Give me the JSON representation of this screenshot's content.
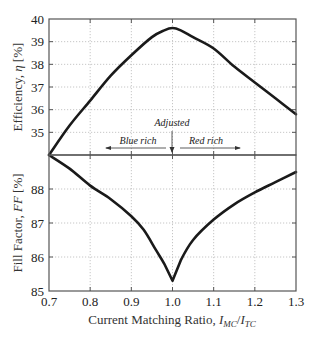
{
  "chart_data": [
    {
      "type": "line",
      "title": "",
      "ylabel": "Efficiency, η [%]",
      "xlabel": "",
      "xlim": [
        0.7,
        1.3
      ],
      "ylim": [
        34,
        40
      ],
      "yticks": [
        "35",
        "36",
        "37",
        "38",
        "39",
        "40"
      ],
      "grid": true,
      "x": [
        0.7,
        0.75,
        0.8,
        0.85,
        0.9,
        0.95,
        0.98,
        1.0,
        1.02,
        1.05,
        1.1,
        1.15,
        1.2,
        1.25,
        1.3
      ],
      "series": [
        {
          "name": "Efficiency",
          "values": [
            34.0,
            35.3,
            36.4,
            37.5,
            38.4,
            39.2,
            39.5,
            39.6,
            39.5,
            39.2,
            38.7,
            37.9,
            37.2,
            36.5,
            35.8
          ]
        }
      ],
      "annotations": [
        {
          "text": "Adjusted",
          "x": 1.0
        },
        {
          "text": "Blue rich",
          "direction": "left"
        },
        {
          "text": "Red rich",
          "direction": "right"
        }
      ]
    },
    {
      "type": "line",
      "title": "",
      "ylabel": "Fill Factor, FF [%]",
      "xlabel": "Current Matching Ratio, I_MC/I_TC",
      "xlim": [
        0.7,
        1.3
      ],
      "ylim": [
        85,
        89
      ],
      "yticks": [
        "85",
        "86",
        "87",
        "88"
      ],
      "xticks": [
        "0.7",
        "0.8",
        "0.9",
        "1.0",
        "1.1",
        "1.2",
        "1.3"
      ],
      "grid": true,
      "x": [
        0.7,
        0.75,
        0.8,
        0.85,
        0.9,
        0.93,
        0.96,
        0.98,
        1.0,
        1.02,
        1.05,
        1.1,
        1.15,
        1.2,
        1.25,
        1.3
      ],
      "series": [
        {
          "name": "Fill Factor",
          "values": [
            89.0,
            88.6,
            88.1,
            87.7,
            87.2,
            86.8,
            86.2,
            85.8,
            85.3,
            85.9,
            86.5,
            87.1,
            87.55,
            87.9,
            88.2,
            88.5
          ]
        }
      ]
    }
  ],
  "labels": {
    "top_ylabel_main": "Efficiency, ",
    "top_ylabel_sym": "η",
    "top_ylabel_unit": " [%]",
    "bottom_ylabel_main": "Fill Factor, ",
    "bottom_ylabel_sym": "FF",
    "bottom_ylabel_unit": " [%]",
    "xlabel_main": "Current Matching Ratio, ",
    "xlabel_i1": "I",
    "xlabel_s1": "MC",
    "xlabel_slash": "/",
    "xlabel_i2": "I",
    "xlabel_s2": "TC",
    "adjusted": "Adjusted",
    "blue_rich": "Blue rich",
    "red_rich": "Red rich"
  }
}
